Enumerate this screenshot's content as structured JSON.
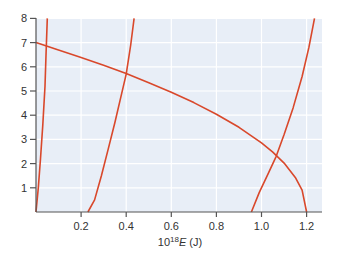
{
  "chart_data": {
    "type": "line",
    "title": "",
    "xlabel": "10^18 E (J)",
    "xlabel_parts": {
      "prefix": "10",
      "superscript": "18",
      "variable": "E",
      "unit": " (J)"
    },
    "ylabel": "",
    "xlim": [
      0,
      1.27
    ],
    "ylim": [
      0,
      8
    ],
    "x_ticks": [
      0.2,
      0.4,
      0.6,
      0.8,
      1.0,
      1.2
    ],
    "x_tick_labels": [
      "0.2",
      "0.4",
      "0.6",
      "0.8",
      "1.0",
      "1.2"
    ],
    "y_ticks": [
      1,
      2,
      3,
      4,
      5,
      6,
      7,
      8
    ],
    "y_tick_labels": [
      "1",
      "2",
      "3",
      "4",
      "5",
      "6",
      "7",
      "8"
    ],
    "grid": true,
    "legend": null,
    "colors": {
      "line": "#d9482b",
      "plot_bg": "#e8eef7",
      "grid": "#ffffff",
      "axis": "#555555",
      "text": "#333333"
    },
    "series": [
      {
        "name": "steep-left-curve",
        "x": [
          0.0,
          0.01,
          0.02,
          0.03,
          0.04,
          0.045,
          0.05
        ],
        "y": [
          0.0,
          1.0,
          2.2,
          3.6,
          5.2,
          6.6,
          8.0
        ]
      },
      {
        "name": "middle-curve",
        "x": [
          0.23,
          0.26,
          0.29,
          0.32,
          0.35,
          0.38,
          0.4,
          0.42,
          0.435
        ],
        "y": [
          0.0,
          0.5,
          1.5,
          2.6,
          3.7,
          4.9,
          5.7,
          6.9,
          8.0
        ]
      },
      {
        "name": "descending-curve",
        "x": [
          0.0,
          0.1,
          0.2,
          0.3,
          0.4,
          0.5,
          0.6,
          0.7,
          0.8,
          0.9,
          1.0,
          1.05,
          1.1,
          1.15,
          1.18,
          1.2
        ],
        "y": [
          7.0,
          6.7,
          6.39,
          6.06,
          5.72,
          5.34,
          4.95,
          4.52,
          4.04,
          3.5,
          2.86,
          2.47,
          2.02,
          1.43,
          0.9,
          0.0
        ]
      },
      {
        "name": "right-curve",
        "x": [
          0.955,
          0.99,
          1.03,
          1.065,
          1.1,
          1.14,
          1.18,
          1.21,
          1.235
        ],
        "y": [
          0.0,
          0.8,
          1.6,
          2.3,
          3.2,
          4.3,
          5.6,
          6.8,
          8.0
        ]
      }
    ]
  }
}
